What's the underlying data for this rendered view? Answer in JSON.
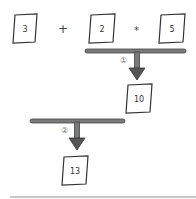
{
  "expression": {
    "operands": [
      {
        "id": "a",
        "value": "3"
      },
      {
        "id": "b",
        "value": "2"
      },
      {
        "id": "c",
        "value": "5"
      }
    ],
    "operators": [
      "+",
      "*"
    ]
  },
  "steps": [
    {
      "label": "①",
      "result": "10"
    },
    {
      "label": "②",
      "result": "13"
    }
  ],
  "colors": {
    "bar": "#7a7a7a",
    "bar_outline": "#444444",
    "card_stroke": "#333333"
  }
}
